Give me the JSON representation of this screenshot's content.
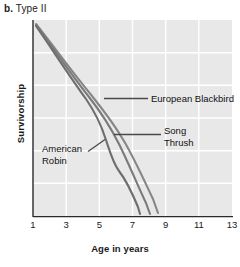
{
  "figure": {
    "panel_letter": "b.",
    "panel_title": "Type II"
  },
  "chart_data": {
    "type": "line",
    "title": "Type II",
    "xlabel": "Age in years",
    "ylabel": "Survivorship",
    "xlim": [
      1,
      13
    ],
    "ylim": [
      0,
      100
    ],
    "xticks": [
      1,
      3,
      5,
      7,
      9,
      11,
      13
    ],
    "yticks": [],
    "grid": true,
    "legend_position": "inline-labels",
    "x": [
      1,
      2,
      3,
      4,
      5,
      6,
      7,
      8,
      9,
      10,
      11
    ],
    "series": [
      {
        "name": "American Robin",
        "color": "#6e6e6e",
        "values": [
          100,
          74,
          55,
          41,
          30,
          21,
          13,
          9,
          4,
          0,
          0
        ],
        "label_x": 2.05,
        "label_y": 36
      },
      {
        "name": "Song Thrush",
        "color": "#7a7a7a",
        "values": [
          100,
          76,
          58,
          45,
          34,
          27,
          21,
          15,
          10,
          5,
          0
        ]
      },
      {
        "name": "European Blackbird",
        "color": "#868686",
        "values": [
          100,
          78,
          61,
          49,
          39,
          32,
          26,
          20,
          14,
          8,
          2
        ]
      }
    ],
    "annotations": [
      {
        "text": "European Blackbird",
        "series": "European Blackbird"
      },
      {
        "text": "Song Thrush",
        "series": "Song Thrush"
      },
      {
        "text": "American Robin",
        "series": "American Robin"
      }
    ],
    "colors": {
      "plot_background": "#e8e8e8",
      "gridline": "#ffffff",
      "axis": "#2a2a2a",
      "text": "#111111"
    }
  },
  "xtick_labels": [
    "1",
    "3",
    "5",
    "7",
    "9",
    "11",
    "13"
  ],
  "labels": {
    "european_blackbird": "European Blackbird",
    "song_thrush_line1": "Song",
    "song_thrush_line2": "Thrush",
    "american_robin_line1": "American",
    "american_robin_line2": "Robin"
  }
}
